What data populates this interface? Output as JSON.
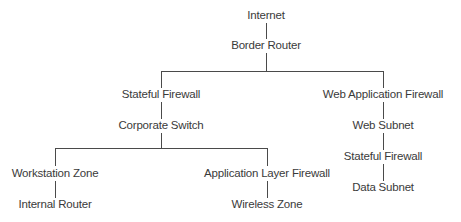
{
  "diagram": {
    "type": "network-topology-tree",
    "line_color": "#4a4a4a",
    "text_color": "#3a3a3a",
    "nodes": {
      "internet": "Internet",
      "border_router": "Border Router",
      "stateful_firewall_left": "Stateful Firewall",
      "corporate_switch": "Corporate Switch",
      "workstation_zone": "Workstation Zone",
      "internal_router": "Internal Router",
      "application_layer_firewall": "Application Layer Firewall",
      "wireless_zone": "Wireless Zone",
      "web_application_firewall": "Web Application Firewall",
      "web_subnet": "Web Subnet",
      "stateful_firewall_right": "Stateful Firewall",
      "data_subnet": "Data Subnet"
    },
    "edges": [
      [
        "Internet",
        "Border Router"
      ],
      [
        "Border Router",
        "Stateful Firewall"
      ],
      [
        "Border Router",
        "Web Application Firewall"
      ],
      [
        "Stateful Firewall",
        "Corporate Switch"
      ],
      [
        "Corporate Switch",
        "Workstation Zone"
      ],
      [
        "Corporate Switch",
        "Application Layer Firewall"
      ],
      [
        "Workstation Zone",
        "Internal Router"
      ],
      [
        "Application Layer Firewall",
        "Wireless Zone"
      ],
      [
        "Web Application Firewall",
        "Web Subnet"
      ],
      [
        "Web Subnet",
        "Stateful Firewall (right)"
      ],
      [
        "Stateful Firewall (right)",
        "Data Subnet"
      ]
    ]
  }
}
